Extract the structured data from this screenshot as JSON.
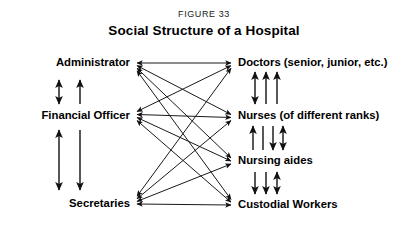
{
  "figure": {
    "label_prefix": "F",
    "label_rest": "IGURE",
    "label_number": "33",
    "label_full": "FIGURE 33",
    "title": "Social Structure of a Hospital"
  },
  "colors": {
    "background": "#ffffff",
    "ink": "#000000",
    "line": "#1a1a1a"
  },
  "nodes": {
    "left": [
      {
        "id": "administrator",
        "label": "Administrator",
        "x": 130,
        "y": 19
      },
      {
        "id": "financial-officer",
        "label": "Financial Officer",
        "x": 130,
        "y": 72
      },
      {
        "id": "secretaries",
        "label": "Secretaries",
        "x": 130,
        "y": 160
      }
    ],
    "right": [
      {
        "id": "doctors",
        "label": "Doctors (senior, junior, etc.)",
        "x": 238,
        "y": 19
      },
      {
        "id": "nurses",
        "label": "Nurses (of different ranks)",
        "x": 238,
        "y": 72
      },
      {
        "id": "nursing-aides",
        "label": "Nursing aides",
        "x": 238,
        "y": 117
      },
      {
        "id": "custodial-workers",
        "label": "Custodial Workers",
        "x": 238,
        "y": 161
      }
    ]
  },
  "edges": {
    "cross_links": [
      {
        "from": "administrator",
        "to": "doctors"
      },
      {
        "from": "administrator",
        "to": "nurses"
      },
      {
        "from": "administrator",
        "to": "nursing-aides"
      },
      {
        "from": "administrator",
        "to": "custodial-workers"
      },
      {
        "from": "financial-officer",
        "to": "doctors"
      },
      {
        "from": "financial-officer",
        "to": "nurses"
      },
      {
        "from": "financial-officer",
        "to": "nursing-aides"
      },
      {
        "from": "financial-officer",
        "to": "custodial-workers"
      },
      {
        "from": "secretaries",
        "to": "doctors"
      },
      {
        "from": "secretaries",
        "to": "nurses"
      },
      {
        "from": "secretaries",
        "to": "nursing-aides"
      },
      {
        "from": "secretaries",
        "to": "custodial-workers"
      }
    ],
    "left_column_links": [
      {
        "from": "administrator",
        "to": "financial-officer",
        "arrows": [
          "both",
          "up"
        ]
      },
      {
        "from": "financial-officer",
        "to": "secretaries",
        "arrows": [
          "both",
          "down"
        ]
      }
    ],
    "right_column_links": [
      {
        "from": "doctors",
        "to": "nurses",
        "arrows": [
          "both",
          "up",
          "up"
        ]
      },
      {
        "from": "nurses",
        "to": "nursing-aides",
        "arrows": [
          "up",
          "none",
          "down",
          "both"
        ]
      },
      {
        "from": "nursing-aides",
        "to": "custodial-workers",
        "arrows": [
          "down",
          "down",
          "both"
        ]
      }
    ]
  }
}
